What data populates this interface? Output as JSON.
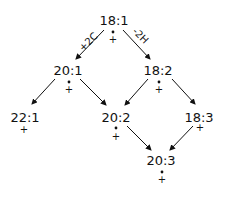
{
  "diagram": {
    "nodes": [
      {
        "id": "n18_1",
        "label": "18:1",
        "dot": true,
        "plus": "+",
        "x": 114,
        "y": 25
      },
      {
        "id": "n20_1",
        "label": "20:1",
        "dot": true,
        "plus": "+",
        "x": 69,
        "y": 75
      },
      {
        "id": "n18_2",
        "label": "18:2",
        "dot": true,
        "plus": "+",
        "x": 159,
        "y": 75
      },
      {
        "id": "n22_1",
        "label": "22:1",
        "dot": false,
        "plus": "+",
        "x": 24,
        "y": 122
      },
      {
        "id": "n20_2",
        "label": "20:2",
        "dot": true,
        "plus": "+",
        "x": 116,
        "y": 122
      },
      {
        "id": "n18_3",
        "label": "18:3",
        "dot": false,
        "plus": "+",
        "x": 200,
        "y": 122
      },
      {
        "id": "n20_3",
        "label": "20:3",
        "dot": true,
        "plus": "+",
        "x": 162,
        "y": 165
      }
    ],
    "edge_labels": {
      "elongation": "+2C",
      "desaturation": "-2H"
    },
    "edges": [
      {
        "from": "18:1",
        "to": "20:1",
        "label": "+2C"
      },
      {
        "from": "18:1",
        "to": "18:2",
        "label": "-2H"
      },
      {
        "from": "20:1",
        "to": "22:1"
      },
      {
        "from": "20:1",
        "to": "20:2"
      },
      {
        "from": "18:2",
        "to": "20:2"
      },
      {
        "from": "18:2",
        "to": "18:3"
      },
      {
        "from": "20:2",
        "to": "20:3"
      },
      {
        "from": "18:3",
        "to": "20:3"
      }
    ]
  }
}
